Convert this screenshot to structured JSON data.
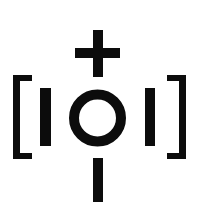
{
  "symbol": {
    "name": "bracketed circle with plus and bars",
    "colors": {
      "foreground": "#0c0c0c",
      "background": "#ffffff"
    },
    "parts": {
      "plus": "plus",
      "left_bracket": "[",
      "left_bar": "I",
      "circle": "O",
      "right_bar": "I",
      "right_bracket": "]",
      "bottom_bar": "|"
    }
  }
}
